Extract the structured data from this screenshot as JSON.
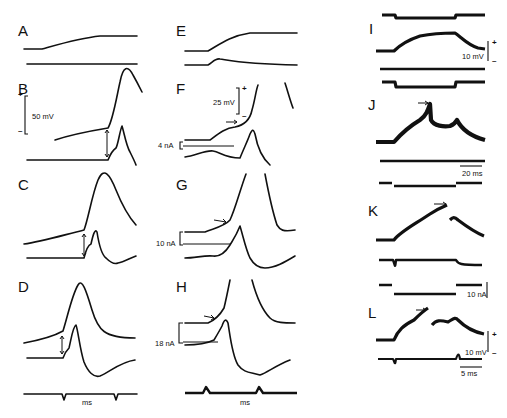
{
  "figure": {
    "panels": [
      "A",
      "B",
      "C",
      "D",
      "E",
      "F",
      "G",
      "H",
      "I",
      "J",
      "K",
      "L"
    ],
    "scale_bars": {
      "B_voltage": "50 mV",
      "F_voltage": "25 mV",
      "F_current": "4 nA",
      "G_current": "10 nA",
      "H_current": "18 nA",
      "I_voltage": "10 mV",
      "J_time": "20 ms",
      "K_current": "10 nA",
      "L_voltage": "10 mV",
      "L_time": "5 ms"
    },
    "time_markers": {
      "D": "ms",
      "H": "ms"
    },
    "polarity": {
      "plus": "+",
      "minus": "–"
    }
  }
}
